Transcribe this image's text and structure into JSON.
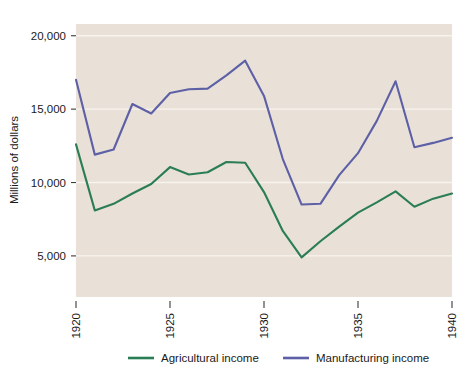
{
  "chart_data": {
    "type": "line",
    "title": "",
    "xlabel": "",
    "ylabel": "Millions of dollars",
    "xlim": [
      1920,
      1940
    ],
    "ylim": [
      2200,
      20800
    ],
    "grid": true,
    "legend_position": "bottom",
    "xtick_labels": [
      "1920",
      "1925",
      "1930",
      "1935",
      "1940"
    ],
    "xticks": [
      1920,
      1925,
      1930,
      1935,
      1940
    ],
    "ytick_labels": [
      "5,000",
      "10,000",
      "15,000",
      "20,000"
    ],
    "yticks": [
      5000,
      10000,
      15000,
      20000
    ],
    "x": [
      1920,
      1921,
      1922,
      1923,
      1924,
      1925,
      1926,
      1927,
      1928,
      1929,
      1930,
      1931,
      1932,
      1933,
      1934,
      1935,
      1936,
      1937,
      1938,
      1939,
      1940
    ],
    "series": [
      {
        "name": "Agricultural income",
        "color": "#2b7d56",
        "values": [
          12600,
          8100,
          8550,
          9250,
          9900,
          11050,
          10550,
          10700,
          11400,
          11350,
          9350,
          6700,
          4900,
          6000,
          7000,
          7950,
          8650,
          9400,
          8350,
          8900,
          9250
        ]
      },
      {
        "name": "Manufacturing income",
        "color": "#5d60a6",
        "values": [
          17000,
          11900,
          12250,
          15350,
          14700,
          16100,
          16350,
          16400,
          17300,
          18300,
          15900,
          11600,
          8500,
          8550,
          10500,
          12000,
          14200,
          16900,
          12400,
          12700,
          13050
        ]
      }
    ]
  },
  "legend": {
    "items": [
      {
        "label": "Agricultural income",
        "color": "#2b7d56"
      },
      {
        "label": "Manufacturing income",
        "color": "#5d60a6"
      }
    ]
  },
  "axes": {
    "y_title": "Millions of dollars"
  }
}
